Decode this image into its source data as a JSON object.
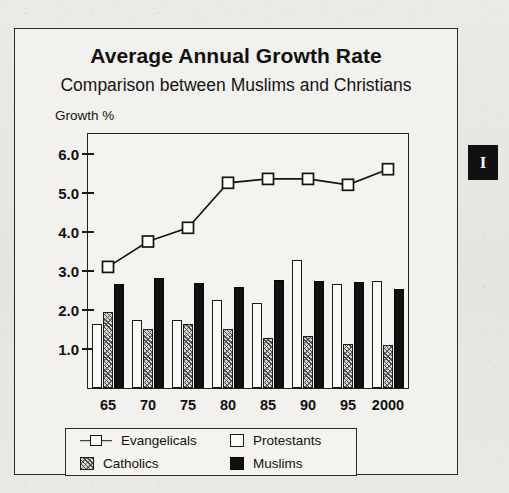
{
  "figure": {
    "title": "Average Annual Growth Rate",
    "subtitle": "Comparison between Muslims and Christians",
    "y_axis_title": "Growth %"
  },
  "margin_tab": {
    "glyph": "I"
  },
  "legend": {
    "items": [
      {
        "label": "Evangelicals",
        "swatch": "line-with-square-marker"
      },
      {
        "label": "Protestants",
        "swatch": "white-square"
      },
      {
        "label": "Catholics",
        "swatch": "hatched-square"
      },
      {
        "label": "Muslims",
        "swatch": "black-square"
      }
    ]
  },
  "chart_data": {
    "type": "bar",
    "title": "Average Annual Growth Rate",
    "subtitle": "Comparison between Muslims and Christians",
    "xlabel": "",
    "ylabel": "Growth %",
    "categories": [
      "65",
      "70",
      "75",
      "80",
      "85",
      "90",
      "95",
      "2000"
    ],
    "yticks": [
      1.0,
      2.0,
      3.0,
      4.0,
      5.0,
      6.0
    ],
    "ytick_labels": [
      "1.0",
      "2.0",
      "3.0",
      "4.0",
      "5.0",
      "6.0"
    ],
    "ylim": [
      0,
      6.5
    ],
    "grid": false,
    "legend_position": "below-plot",
    "series": [
      {
        "name": "Evangelicals",
        "type": "line",
        "marker": "open-square",
        "values": [
          3.1,
          3.75,
          4.1,
          5.25,
          5.35,
          5.35,
          5.2,
          5.6
        ]
      },
      {
        "name": "Protestants",
        "type": "bar",
        "fill": "white",
        "values": [
          1.65,
          1.75,
          1.75,
          2.25,
          2.18,
          3.28,
          2.65,
          2.75
        ]
      },
      {
        "name": "Catholics",
        "type": "bar",
        "fill": "hatched",
        "values": [
          1.95,
          1.52,
          1.65,
          1.5,
          1.28,
          1.32,
          1.13,
          1.1
        ]
      },
      {
        "name": "Muslims",
        "type": "bar",
        "fill": "black",
        "values": [
          2.67,
          2.82,
          2.7,
          2.58,
          2.77,
          2.75,
          2.72,
          2.53
        ]
      }
    ]
  },
  "colors": {
    "ink": "#111111",
    "paper": "#f2f1ed",
    "page": "#e9e8e4",
    "hatch": "#d8d8d4"
  }
}
